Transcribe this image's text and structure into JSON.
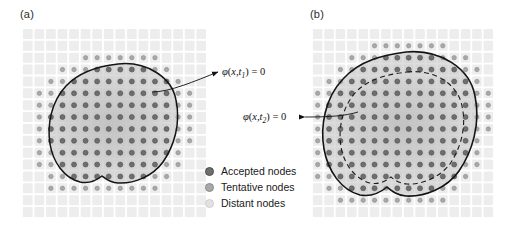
{
  "figure": {
    "panels": [
      {
        "label": "(a)"
      },
      {
        "label": "(b)"
      }
    ]
  },
  "annotations": {
    "t1": {
      "phi": "φ",
      "open": "(",
      "x": "x",
      "comma": ",",
      "t": "t",
      "sub": "1",
      "close": ")",
      "equals": " = 0"
    },
    "t2": {
      "phi": "φ",
      "open": "(",
      "x": "x",
      "comma": ",",
      "t": "t",
      "sub": "2",
      "close": ")",
      "equals": " = 0"
    }
  },
  "legend": {
    "items": [
      {
        "label": "Accepted nodes",
        "color": "#6e6e6e",
        "ring": "#4d4d4d"
      },
      {
        "label": "Tentative nodes",
        "color": "#a8a8a8",
        "ring": "#8a8a8a"
      },
      {
        "label": "Distant nodes",
        "color": "#e2e2e2",
        "ring": "#cfcfcf"
      }
    ]
  },
  "chart_data": {
    "type": "diagram",
    "panels": [
      {
        "name": "(a)",
        "contours": [
          {
            "name": "zero-level-set-t1",
            "style": "solid",
            "label": "φ(x,t₁) = 0"
          }
        ],
        "grid": {
          "columns": 16,
          "rows": 16
        },
        "node_classes": [
          "accepted",
          "tentative",
          "distant"
        ]
      },
      {
        "name": "(b)",
        "contours": [
          {
            "name": "zero-level-set-t2",
            "style": "solid",
            "label": "φ(x,t₂) = 0"
          },
          {
            "name": "zero-level-set-t1-previous",
            "style": "dashed",
            "label": ""
          }
        ],
        "grid": {
          "columns": 16,
          "rows": 16
        },
        "node_classes": [
          "accepted",
          "tentative",
          "distant"
        ]
      }
    ],
    "legend": [
      "Accepted nodes",
      "Tentative nodes",
      "Distant nodes"
    ],
    "colors": {
      "accepted": "#6e6e6e",
      "tentative": "#a8a8a8",
      "distant": "#e2e2e2",
      "grid_cell": "#ededed",
      "contour": "#1a1a1a"
    }
  }
}
